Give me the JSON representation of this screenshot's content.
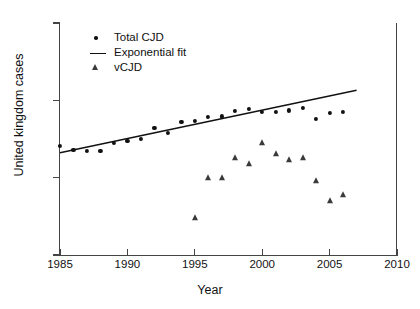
{
  "chart_data": {
    "type": "scatter",
    "title": "",
    "xlabel": "Year",
    "ylabel": "United kingdom cases",
    "xlim": [
      1985,
      2010
    ],
    "ylim": [
      1,
      1000
    ],
    "yscale": "log",
    "grid": false,
    "legend_position": "top-left",
    "xticks": [
      1985,
      1990,
      1995,
      2000,
      2005,
      2010
    ],
    "yticks": [
      1,
      10,
      100,
      1000
    ],
    "xtick_labels": [
      "1985",
      "1990",
      "1995",
      "2000",
      "2005",
      "2010"
    ],
    "ytick_labels": [
      "1",
      "10",
      "100",
      "1000"
    ],
    "legend": [
      {
        "label": "Total CJD",
        "marker": "dot"
      },
      {
        "label": "Exponential fit",
        "marker": "line"
      },
      {
        "label": "vCJD",
        "marker": "triangle"
      }
    ],
    "series": [
      {
        "name": "Total CJD",
        "marker": "dot",
        "x": [
          1985,
          1986,
          1987,
          1988,
          1989,
          1990,
          1991,
          1992,
          1993,
          1994,
          1995,
          1996,
          1997,
          1998,
          1999,
          2000,
          2001,
          2002,
          2003,
          2004,
          2005,
          2006
        ],
        "values": [
          26,
          23,
          22,
          22,
          28,
          30,
          32,
          44,
          38,
          52,
          54,
          61,
          62,
          73,
          78,
          70,
          71,
          74,
          79,
          58,
          69,
          70
        ]
      },
      {
        "name": "vCJD",
        "marker": "triangle",
        "x": [
          1995,
          1996,
          1997,
          1998,
          1999,
          2000,
          2001,
          2002,
          2003,
          2004,
          2005,
          2006
        ],
        "values": [
          3,
          10,
          10,
          18,
          15,
          28,
          20,
          17,
          18,
          9,
          5,
          6
        ]
      },
      {
        "name": "Exponential fit",
        "marker": "line",
        "x": [
          1985,
          2007
        ],
        "values": [
          21,
          135
        ]
      }
    ]
  },
  "axes": {
    "ylabel": "United kingdom cases",
    "xlabel": "Year"
  }
}
